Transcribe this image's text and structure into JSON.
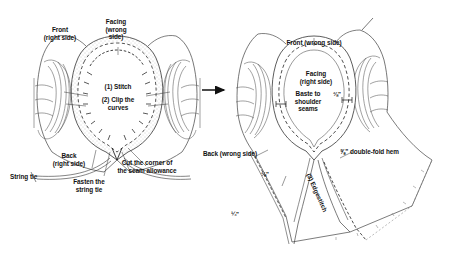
{
  "figure": {
    "steps_total": 3,
    "arrow": "right-arrow"
  },
  "left_panel": {
    "name": "Step 1 and 2 — stitch and clip",
    "labels": {
      "front": "Front\n(right side)",
      "facing": "Facing\n(wrong\nside)",
      "step1": "(1) Stitch",
      "step2": "(2) Clip the\ncurves",
      "back": "Back\n(right side)",
      "string_tie": "String tie",
      "fasten": "Fasten the\nstring tie",
      "cut_corner": "Cut the corner of\nthe seam allowance"
    }
  },
  "right_panel": {
    "name": "Step 3 — baste, hem and edgestitch",
    "labels": {
      "front": "Front (wrong side)",
      "facing": "Facing\n(right side)",
      "baste": "Baste to\nshoulder\nseams",
      "back": "Back (wrong side)",
      "neck_allowance": "⅜\"",
      "side_allowance": "⅜\"",
      "hem_allowance": "¼\"",
      "double_fold_hem": "⅝\" double-fold hem",
      "step3": "(3) Edgestitch"
    }
  },
  "colors": {
    "ink": "#1a1a1a",
    "line": "#4a4a4a",
    "hatch": "#8c8c8c",
    "paper": "#ffffff",
    "stipple": "#9a9a9a"
  }
}
